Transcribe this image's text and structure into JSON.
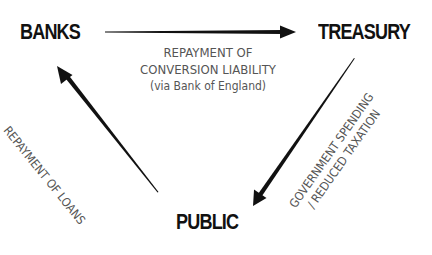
{
  "diagram": {
    "type": "flow-triangle",
    "colors": {
      "background": "#ffffff",
      "node_text": "#111111",
      "label_text": "#555555",
      "arrow": "#111111"
    },
    "nodes": {
      "banks": {
        "label": "BANKS"
      },
      "treasury": {
        "label": "TREASURY"
      },
      "public": {
        "label": "PUBLIC"
      }
    },
    "edges": {
      "banks_to_treasury": {
        "from": "BANKS",
        "to": "TREASURY",
        "label_line1": "REPAYMENT OF",
        "label_line2": "CONVERSION LIABILITY",
        "label_line3": "(via Bank of England)"
      },
      "treasury_to_public": {
        "from": "TREASURY",
        "to": "PUBLIC",
        "label_line1": "GOVERNMENT SPENDING",
        "label_line2": "/ REDUCED TAXATION"
      },
      "public_to_banks": {
        "from": "PUBLIC",
        "to": "BANKS",
        "label_line1": "REPAYMENT OF LOANS"
      }
    }
  }
}
